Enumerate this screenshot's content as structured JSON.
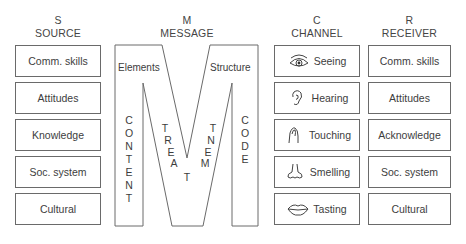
{
  "source": {
    "letter": "S",
    "title": "SOURCE",
    "items": [
      "Comm. skills",
      "Attitudes",
      "Knowledge",
      "Soc. system",
      "Cultural"
    ]
  },
  "message": {
    "letter": "M",
    "title": "MESSAGE",
    "elements_label": "Elements",
    "structure_label": "Structure",
    "content": [
      "C",
      "O",
      "N",
      "T",
      "E",
      "N",
      "T"
    ],
    "treat": [
      "T",
      "R",
      "E",
      "A"
    ],
    "treat_bottom": "T",
    "ment": [
      "T",
      "N",
      "E",
      "M"
    ],
    "code": [
      "C",
      "O",
      "D",
      "E"
    ]
  },
  "channel": {
    "letter": "C",
    "title": "CHANNEL",
    "items": [
      {
        "label": "Seeing",
        "icon": "eye-icon"
      },
      {
        "label": "Hearing",
        "icon": "ear-icon"
      },
      {
        "label": "Touching",
        "icon": "hand-icon"
      },
      {
        "label": "Smelling",
        "icon": "nose-icon"
      },
      {
        "label": "Tasting",
        "icon": "lips-icon"
      }
    ]
  },
  "receiver": {
    "letter": "R",
    "title": "RECEIVER",
    "items": [
      "Comm. skills",
      "Attitudes",
      "Acknowledge",
      "Soc. system",
      "Cultural"
    ]
  },
  "colors": {
    "line": "#6a6a6a",
    "text": "#3d3d3d",
    "background": "#ffffff"
  }
}
